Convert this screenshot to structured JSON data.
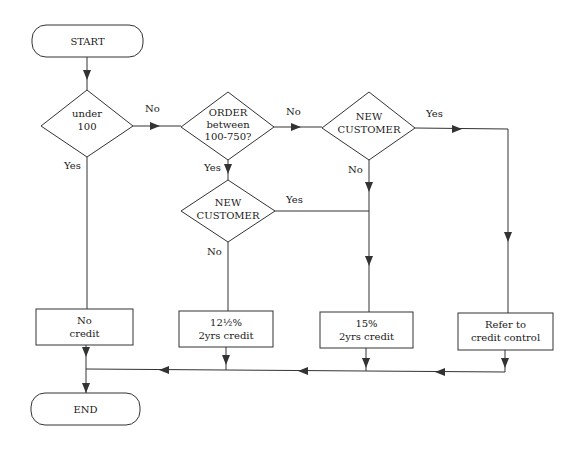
{
  "diagram": {
    "type": "flowchart",
    "colors": {
      "line": "#333333",
      "background": "#ffffff",
      "text": "#1a1a1a"
    },
    "nodes": {
      "start": {
        "shape": "terminator",
        "text": "START"
      },
      "end": {
        "shape": "terminator",
        "text": "END"
      },
      "decision_under_100": {
        "shape": "decision",
        "line1": "under",
        "line2": "100"
      },
      "decision_order_range": {
        "shape": "decision",
        "line1": "ORDER",
        "line2": "between",
        "line3": "100-750?"
      },
      "decision_new_customer_top": {
        "shape": "decision",
        "line1": "NEW",
        "line2": "CUSTOMER"
      },
      "decision_new_customer_lower": {
        "shape": "decision",
        "line1": "NEW",
        "line2": "CUSTOMER"
      },
      "process_no_credit": {
        "shape": "process",
        "line1": "No",
        "line2": "credit"
      },
      "process_12_5_percent": {
        "shape": "process",
        "line1": "12½%",
        "line2": "2yrs credit"
      },
      "process_15_percent": {
        "shape": "process",
        "line1": "15%",
        "line2": "2yrs credit"
      },
      "process_refer": {
        "shape": "process",
        "line1": "Refer to",
        "line2": "credit control"
      }
    },
    "edge_labels": {
      "under100_no": "No",
      "under100_yes": "Yes",
      "order_no": "No",
      "order_yes": "Yes",
      "newcust_top_yes": "Yes",
      "newcust_top_no": "No",
      "newcust_lower_yes": "Yes",
      "newcust_lower_no": "No"
    },
    "edges": [
      {
        "from": "start",
        "to": "decision_under_100"
      },
      {
        "from": "decision_under_100",
        "to": "decision_order_range",
        "label": "No"
      },
      {
        "from": "decision_under_100",
        "to": "process_no_credit",
        "label": "Yes"
      },
      {
        "from": "decision_order_range",
        "to": "decision_new_customer_top",
        "label": "No"
      },
      {
        "from": "decision_order_range",
        "to": "decision_new_customer_lower",
        "label": "Yes"
      },
      {
        "from": "decision_new_customer_top",
        "to": "process_refer",
        "label": "Yes"
      },
      {
        "from": "decision_new_customer_top",
        "to": "process_15_percent",
        "label": "No"
      },
      {
        "from": "decision_new_customer_lower",
        "to": "process_15_percent",
        "label": "Yes"
      },
      {
        "from": "decision_new_customer_lower",
        "to": "process_12_5_percent",
        "label": "No"
      },
      {
        "from": "process_no_credit",
        "to": "end"
      },
      {
        "from": "process_12_5_percent",
        "to": "end"
      },
      {
        "from": "process_15_percent",
        "to": "end"
      },
      {
        "from": "process_refer",
        "to": "end"
      }
    ]
  }
}
